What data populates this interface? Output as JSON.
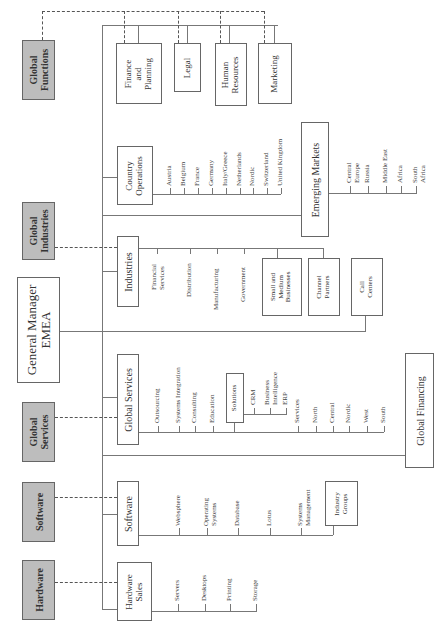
{
  "global_units": {
    "functions": "Global\nFunctions",
    "industries": "Global\nIndustries",
    "services": "Global\nServices",
    "software": "Software",
    "hardware": "Hardware"
  },
  "general_manager": "General Manager\nEMEA",
  "functions": {
    "finance": "Finance\nand\nPlanning",
    "legal": "Legal",
    "hr": "Human\nResources",
    "marketing": "Marketing"
  },
  "country_operations": {
    "title": "Country\nOperations",
    "items": [
      "Austria",
      "Belgium",
      "France",
      "Germany",
      "Italy/Greece",
      "Netherlands",
      "Nordic",
      "Switzerland",
      "United Kingdom"
    ]
  },
  "emerging_markets": {
    "title": "Emerging Markets",
    "items": [
      "Central\nEurope",
      "Russia",
      "Middle East",
      "Africa",
      "South\nAfrica"
    ]
  },
  "industries": {
    "title": "Industries",
    "items": [
      "Financial\nServices",
      "Distribution",
      "Manufacturing",
      "Government"
    ],
    "boxes": [
      "Small and\nMedium\nBusinesses",
      "Channel\nPartners",
      "Call\nCenters"
    ]
  },
  "global_services": {
    "title": "Global Services",
    "items": [
      "Outsourcing",
      "Systems Integration",
      "Consulting",
      "Education"
    ],
    "solutions": {
      "title": "Solutions",
      "items": [
        "CRM",
        "Business\nIntelligence",
        "ERP"
      ]
    },
    "services_label": "Services",
    "regions": [
      "North",
      "Central",
      "Nordic",
      "West",
      "South"
    ]
  },
  "global_financing": "Global Financing",
  "software": {
    "title": "Software",
    "items": [
      "Websphere",
      "Operating\nSystems",
      "Database",
      "Lotus",
      "Systems\nManagement"
    ],
    "box": "Industry\nGroups"
  },
  "hardware_sales": {
    "title": "Hardware\nSales",
    "items": [
      "Servers",
      "Desktops",
      "Printing",
      "Storage"
    ]
  }
}
